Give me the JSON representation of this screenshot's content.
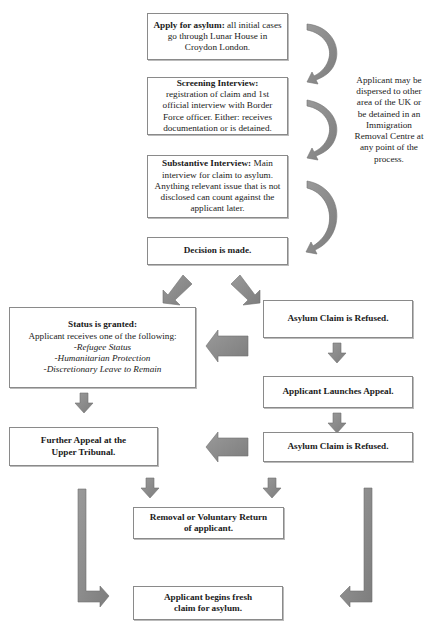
{
  "flowchart": {
    "steps": {
      "apply": {
        "title": "Apply for asylum:",
        "text": " all initial cases go through Lunar House in Croydon London."
      },
      "screening": {
        "title": "Screening Interview:",
        "text": "registration of claim and 1st official interview with Border Force officer. Either: receives documentation or is detained."
      },
      "substantive": {
        "title": "Substantive Interview:",
        "text": " Main interview for claim to asylum. Anything relevant issue that is not disclosed can count against the applicant later."
      },
      "decision": {
        "title": "Decision is made."
      },
      "granted": {
        "title": "Status is granted:",
        "text": "Applicant receives one of the following:",
        "options": [
          "-Refugee Status",
          "-Humanitarian Protection",
          "-Discretionary Leave to Remain"
        ]
      },
      "refused_1": {
        "title": "Asylum Claim is Refused."
      },
      "appeal": {
        "title": "Applicant Launches Appeal."
      },
      "further_appeal": {
        "title": "Further Appeal at the Upper Tribunal."
      },
      "refused_2": {
        "title": "Asylum Claim is Refused."
      },
      "removal": {
        "title": "Removal or Voluntary Return of applicant."
      },
      "fresh_claim": {
        "title": "Applicant begins fresh claim for asylum."
      }
    },
    "side_note": "Applicant may be dispersed to other area of the UK or be detained in an Immigration Removal Centre at any point of the process.",
    "colors": {
      "arrow_fill": "#8c8c8c",
      "arrow_stroke": "#6e6e6e",
      "box_border": "#8a8a8a"
    }
  }
}
